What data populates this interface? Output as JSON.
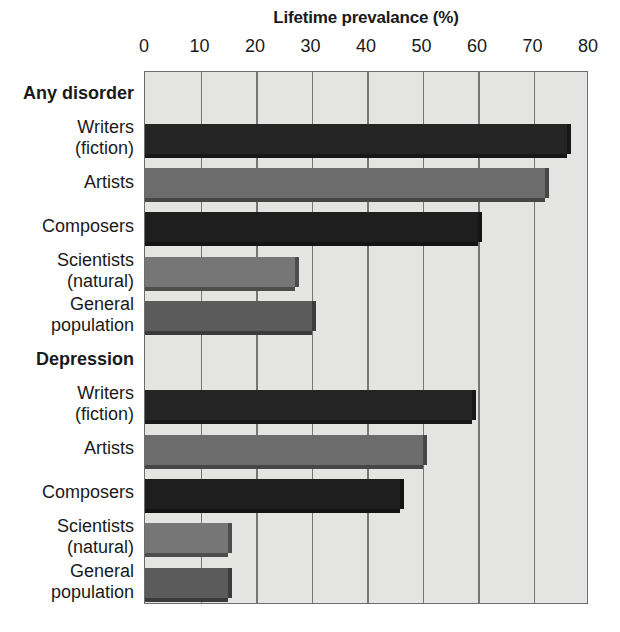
{
  "chart_data": {
    "type": "bar",
    "orientation": "horizontal",
    "title": "Lifetime prevalance (%)",
    "xlabel": "Lifetime prevalance (%)",
    "ylabel": "",
    "xlim": [
      0,
      80
    ],
    "xticks": [
      0,
      10,
      20,
      30,
      40,
      50,
      60,
      70,
      80
    ],
    "xtick_labels": [
      "0",
      "10",
      "20",
      "30",
      "40",
      "50",
      "60",
      "70",
      "80"
    ],
    "grid": "vertical",
    "legend": "none",
    "groups": [
      {
        "name": "Any disorder",
        "categories": [
          "Writers (fiction)",
          "Artists",
          "Composers",
          "Scientists (natural)",
          "General population"
        ],
        "values": [
          76,
          72,
          60,
          27,
          30
        ]
      },
      {
        "name": "Depression",
        "categories": [
          "Writers (fiction)",
          "Artists",
          "Composers",
          "Scientists (natural)",
          "General population"
        ],
        "values": [
          59,
          50,
          46,
          15,
          15
        ]
      }
    ],
    "bar_colors": {
      "writers": "#252525",
      "artists": "#6c6c6c",
      "composers": "#1e1e1e",
      "scientists": "#767676",
      "general_population": "#5b5b5b"
    },
    "plot_background": "#e4e4e2",
    "gridline_color": "#757575",
    "frame_color": "#6d6d6d"
  },
  "axis": {
    "ticks": [
      {
        "label": "0",
        "value": 0
      },
      {
        "label": "10",
        "value": 10
      },
      {
        "label": "20",
        "value": 20
      },
      {
        "label": "30",
        "value": 30
      },
      {
        "label": "40",
        "value": 40
      },
      {
        "label": "50",
        "value": 50
      },
      {
        "label": "60",
        "value": 60
      },
      {
        "label": "70",
        "value": 70
      },
      {
        "label": "80",
        "value": 80
      }
    ]
  },
  "rows": [
    {
      "kind": "header",
      "label": "Any disorder",
      "line1": "Any disorder",
      "line2": "",
      "value": null,
      "color_key": null
    },
    {
      "kind": "bar",
      "label": "Writers (fiction)",
      "line1": "Writers",
      "line2": "(fiction)",
      "value": 76,
      "color_key": "writers"
    },
    {
      "kind": "bar",
      "label": "Artists",
      "line1": "Artists",
      "line2": "",
      "value": 72,
      "color_key": "artists"
    },
    {
      "kind": "bar",
      "label": "Composers",
      "line1": "Composers",
      "line2": "",
      "value": 60,
      "color_key": "composers"
    },
    {
      "kind": "bar",
      "label": "Scientists (natural)",
      "line1": "Scientists",
      "line2": "(natural)",
      "value": 27,
      "color_key": "scientists"
    },
    {
      "kind": "bar",
      "label": "General population",
      "line1": "General",
      "line2": "population",
      "value": 30,
      "color_key": "general_population"
    },
    {
      "kind": "header",
      "label": "Depression",
      "line1": "Depression",
      "line2": "",
      "value": null,
      "color_key": null
    },
    {
      "kind": "bar",
      "label": "Writers (fiction)",
      "line1": "Writers",
      "line2": "(fiction)",
      "value": 59,
      "color_key": "writers"
    },
    {
      "kind": "bar",
      "label": "Artists",
      "line1": "Artists",
      "line2": "",
      "value": 50,
      "color_key": "artists"
    },
    {
      "kind": "bar",
      "label": "Composers",
      "line1": "Composers",
      "line2": "",
      "value": 46,
      "color_key": "composers"
    },
    {
      "kind": "bar",
      "label": "Scientists (natural)",
      "line1": "Scientists",
      "line2": "(natural)",
      "value": 15,
      "color_key": "scientists"
    },
    {
      "kind": "bar",
      "label": "General population",
      "line1": "General",
      "line2": "population",
      "value": 15,
      "color_key": "general_population"
    }
  ]
}
